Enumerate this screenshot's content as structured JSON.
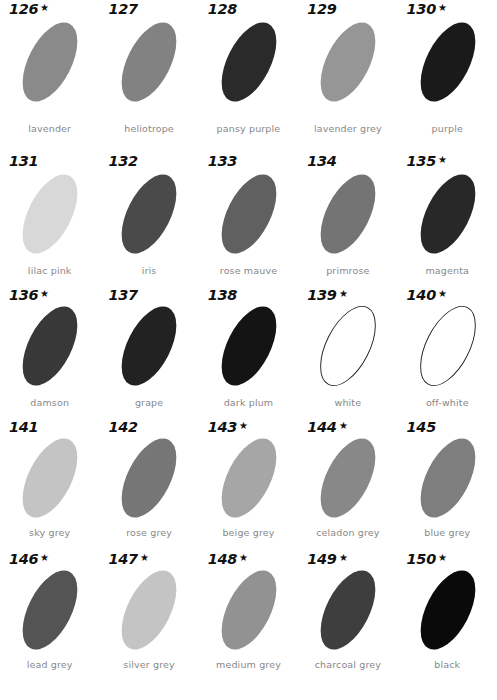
{
  "page": {
    "kind": "colour-swatch-chart",
    "background": "#ffffff",
    "number_color": "#111111",
    "caption_color": "#888888",
    "star_glyph": "★",
    "columns": 5,
    "rows": 5
  },
  "chart_data": {
    "type": "table",
    "title": "",
    "xlabel": "",
    "ylabel": "",
    "categories": [
      "126",
      "127",
      "128",
      "129",
      "130",
      "131",
      "132",
      "133",
      "134",
      "135",
      "136",
      "137",
      "138",
      "139",
      "140",
      "141",
      "142",
      "143",
      "144",
      "145",
      "146",
      "147",
      "148",
      "149",
      "150"
    ],
    "values": [
      138,
      130,
      42,
      150,
      26,
      216,
      74,
      96,
      116,
      40,
      56,
      34,
      20,
      255,
      255,
      196,
      118,
      166,
      136,
      126,
      84,
      196,
      146,
      62,
      10
    ],
    "legend": []
  },
  "swatches": [
    {
      "number": "126",
      "star": true,
      "name": "lavender",
      "fill": "#8a8a8a",
      "outlined": false
    },
    {
      "number": "127",
      "star": false,
      "name": "heliotrope",
      "fill": "#828282",
      "outlined": false
    },
    {
      "number": "128",
      "star": false,
      "name": "pansy purple",
      "fill": "#2a2a2a",
      "outlined": false
    },
    {
      "number": "129",
      "star": false,
      "name": "lavender grey",
      "fill": "#969696",
      "outlined": false
    },
    {
      "number": "130",
      "star": true,
      "name": "purple",
      "fill": "#1a1a1a",
      "outlined": false
    },
    {
      "number": "131",
      "star": false,
      "name": "lilac pink",
      "fill": "#d8d8d8",
      "outlined": false
    },
    {
      "number": "132",
      "star": false,
      "name": "iris",
      "fill": "#4a4a4a",
      "outlined": false
    },
    {
      "number": "133",
      "star": false,
      "name": "rose mauve",
      "fill": "#606060",
      "outlined": false
    },
    {
      "number": "134",
      "star": false,
      "name": "primrose",
      "fill": "#747474",
      "outlined": false
    },
    {
      "number": "135",
      "star": true,
      "name": "magenta",
      "fill": "#282828",
      "outlined": false
    },
    {
      "number": "136",
      "star": true,
      "name": "damson",
      "fill": "#383838",
      "outlined": false
    },
    {
      "number": "137",
      "star": false,
      "name": "grape",
      "fill": "#222222",
      "outlined": false
    },
    {
      "number": "138",
      "star": false,
      "name": "dark plum",
      "fill": "#141414",
      "outlined": false
    },
    {
      "number": "139",
      "star": true,
      "name": "white",
      "fill": "#ffffff",
      "outlined": true
    },
    {
      "number": "140",
      "star": true,
      "name": "off-white",
      "fill": "#ffffff",
      "outlined": true
    },
    {
      "number": "141",
      "star": false,
      "name": "sky grey",
      "fill": "#c4c4c4",
      "outlined": false
    },
    {
      "number": "142",
      "star": false,
      "name": "rose grey",
      "fill": "#767676",
      "outlined": false
    },
    {
      "number": "143",
      "star": true,
      "name": "beige grey",
      "fill": "#a6a6a6",
      "outlined": false
    },
    {
      "number": "144",
      "star": true,
      "name": "celadon grey",
      "fill": "#888888",
      "outlined": false
    },
    {
      "number": "145",
      "star": false,
      "name": "blue grey",
      "fill": "#7e7e7e",
      "outlined": false
    },
    {
      "number": "146",
      "star": true,
      "name": "lead grey",
      "fill": "#545454",
      "outlined": false
    },
    {
      "number": "147",
      "star": true,
      "name": "silver grey",
      "fill": "#c4c4c4",
      "outlined": false
    },
    {
      "number": "148",
      "star": true,
      "name": "medium grey",
      "fill": "#929292",
      "outlined": false
    },
    {
      "number": "149",
      "star": true,
      "name": "charcoal grey",
      "fill": "#3e3e3e",
      "outlined": false
    },
    {
      "number": "150",
      "star": true,
      "name": "black",
      "fill": "#0a0a0a",
      "outlined": false
    }
  ]
}
